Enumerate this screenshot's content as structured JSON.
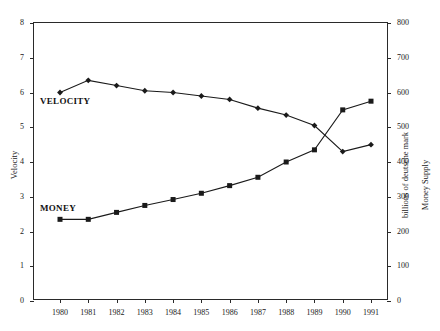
{
  "caption": {
    "top_strip": "· ···· · ·· · ·· ·· · ··· · ·· ·"
  },
  "chart_data": {
    "type": "line",
    "title": "",
    "xlabel": "",
    "ylabel": "Velocity",
    "y2label": "Money Supply",
    "y2label_units": "billions of deutsche mark",
    "grid": false,
    "legend_position": "inline-annotations",
    "x": [
      1980,
      1981,
      1982,
      1983,
      1984,
      1985,
      1986,
      1987,
      1988,
      1989,
      1990,
      1991
    ],
    "xtick_labels": [
      "1980",
      "1981",
      "1982",
      "1983",
      "1984",
      "1985",
      "1986",
      "1987",
      "1988",
      "1989",
      "1990",
      "1991"
    ],
    "ylim": [
      0,
      8
    ],
    "ytick_labels": [
      "0",
      "1",
      "2",
      "3",
      "4",
      "5",
      "6",
      "7",
      "8"
    ],
    "y2lim": [
      0,
      800
    ],
    "y2tick_labels": [
      "0",
      "100",
      "200",
      "300",
      "400",
      "500",
      "600",
      "700",
      "800"
    ],
    "series": [
      {
        "name": "VELOCITY",
        "axis": "left",
        "marker": "diamond",
        "annotation": "VELOCITY",
        "values": [
          6.0,
          6.35,
          6.2,
          6.05,
          6.0,
          5.9,
          5.8,
          5.55,
          5.35,
          5.05,
          4.3,
          4.5
        ]
      },
      {
        "name": "MONEY",
        "axis": "right",
        "marker": "square",
        "annotation": "MONEY",
        "values": [
          235,
          235,
          255,
          275,
          292,
          310,
          332,
          356,
          400,
          435,
          550,
          575
        ]
      }
    ]
  },
  "colors": {
    "axis": "#2a2a2a",
    "series_velocity": "#1a1a1a",
    "series_money": "#1a1a1a",
    "background": "#ffffff"
  }
}
